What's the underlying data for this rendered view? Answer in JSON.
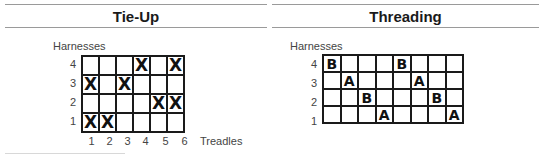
{
  "tieup": {
    "title": "Tie-Up",
    "y_label": "Harnesses",
    "x_label": "Treadles",
    "rows": [
      "4",
      "3",
      "2",
      "1"
    ],
    "cols": [
      "1",
      "2",
      "3",
      "4",
      "5",
      "6"
    ],
    "grid": [
      [
        "",
        "",
        "",
        "X",
        "",
        "X"
      ],
      [
        "X",
        "",
        "X",
        "",
        "",
        ""
      ],
      [
        "",
        "",
        "",
        "",
        "X",
        "X"
      ],
      [
        "X",
        "X",
        "",
        "",
        "",
        ""
      ]
    ]
  },
  "threading": {
    "title": "Threading",
    "y_label": "Harnesses",
    "rows": [
      "4",
      "3",
      "2",
      "1"
    ],
    "grid": [
      [
        "B",
        "",
        "",
        "",
        "B",
        "",
        "",
        ""
      ],
      [
        "",
        "A",
        "",
        "",
        "",
        "A",
        "",
        ""
      ],
      [
        "",
        "",
        "B",
        "",
        "",
        "",
        "B",
        ""
      ],
      [
        "",
        "",
        "",
        "A",
        "",
        "",
        "",
        "A"
      ]
    ]
  }
}
